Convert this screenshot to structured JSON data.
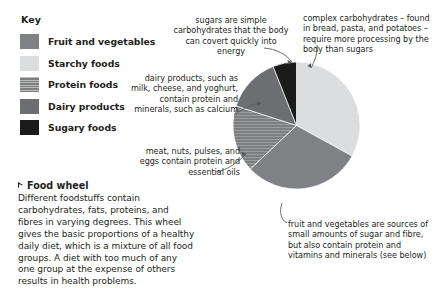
{
  "legend": {
    "title": "Key",
    "items": [
      {
        "label": "Fruit and vegetables",
        "color": "#808184",
        "pattern": "solid"
      },
      {
        "label": "Starchy foods",
        "color": "#dcdddf",
        "pattern": "solid"
      },
      {
        "label": "Protein foods",
        "color": "#7c7e80",
        "pattern": "hatched"
      },
      {
        "label": "Dairy products",
        "color": "#6d6e71",
        "pattern": "solid"
      },
      {
        "label": "Sugary foods",
        "color": "#1b1b1b",
        "pattern": "solid"
      }
    ]
  },
  "caption": {
    "heading": "Food wheel",
    "body": "Different foodstuffs contain carbohydrates, fats, proteins, and fibres in varying degrees. This wheel gives the basic proportions of a healthy daily diet, which is a mixture of all food groups. A diet with too much of any one group at the expense of others results in health problems."
  },
  "annotations": {
    "sugars": "sugars are simple carbohydrates that the body can covert quickly into energy",
    "complex": "complex carbohydrates – found in bread, pasta, and potatoes – require more processing by the body than sugars",
    "dairy": "dairy products, such as milk, cheese, and yoghurt, contain protein and minerals, such as calcium",
    "protein": "meat, nuts, pulses, and eggs contain protein and essential oils",
    "fruitveg": "fruit and vegetables are sources of small amounts of sugar and fibre, but also contain protein and vitamins and minerals (see below)"
  },
  "chart_data": {
    "type": "pie",
    "title": "Food wheel",
    "legend_position": "left",
    "categories": [
      "Starchy foods",
      "Fruit and vegetables",
      "Protein foods",
      "Dairy products",
      "Sugary foods"
    ],
    "values": [
      33,
      30,
      17,
      14,
      6
    ],
    "unit": "percent of daily diet",
    "colors": [
      "#dcdddf",
      "#808184",
      "#7c7e80",
      "#6d6e71",
      "#1b1b1b"
    ],
    "patterns": [
      "solid",
      "solid",
      "hatched",
      "solid",
      "solid"
    ],
    "start_angle_deg": 0,
    "direction": "clockwise",
    "labels": [
      "complex carbohydrates – found in bread, pasta, and potatoes – require more processing by the body than sugars",
      "fruit and vegetables are sources of small amounts of sugar and fibre, but also contain protein and vitamins and minerals (see below)",
      "meat, nuts, pulses, and eggs contain protein and essential oils",
      "dairy products, such as milk, cheese, and yoghurt, contain protein and minerals, such as calcium",
      "sugars are simple carbohydrates that the body can covert quickly into energy"
    ]
  }
}
